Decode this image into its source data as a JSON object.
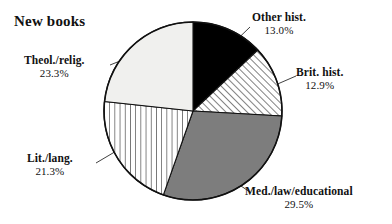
{
  "chart_data": {
    "type": "pie",
    "title": "New books",
    "xlabel": "",
    "ylabel": "",
    "legend": "none",
    "grid": false,
    "start_angle_deg": 0,
    "direction": "clockwise",
    "categories": [
      "Other hist.",
      "Brit. hist.",
      "Med./law/educational",
      "Lit./lang.",
      "Theol./relig."
    ],
    "values": [
      13.0,
      12.9,
      29.5,
      21.3,
      23.3
    ],
    "unit": "%",
    "slices": [
      {
        "label": "Other hist.",
        "percent": "13.0%",
        "value": 13.0,
        "fill_style": "solid-black",
        "color": "#000000"
      },
      {
        "label": "Brit. hist.",
        "percent": "12.9%",
        "value": 12.9,
        "fill_style": "diagonal-hatch",
        "color": "#ffffff"
      },
      {
        "label": "Med./law/educational",
        "percent": "29.5%",
        "value": 29.5,
        "fill_style": "solid-gray",
        "color": "#7d7d7d"
      },
      {
        "label": "Lit./lang.",
        "percent": "21.3%",
        "value": 21.3,
        "fill_style": "vertical-hatch",
        "color": "#ffffff"
      },
      {
        "label": "Theol./relig.",
        "percent": "23.3%",
        "value": 23.3,
        "fill_style": "solid-light",
        "color": "#f0f0ee"
      }
    ]
  }
}
